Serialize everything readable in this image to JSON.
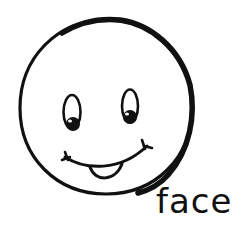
{
  "illustration": {
    "subject": "smiley-face",
    "caption": "face",
    "colors": {
      "ink": "#111111",
      "background": "#ffffff"
    }
  }
}
